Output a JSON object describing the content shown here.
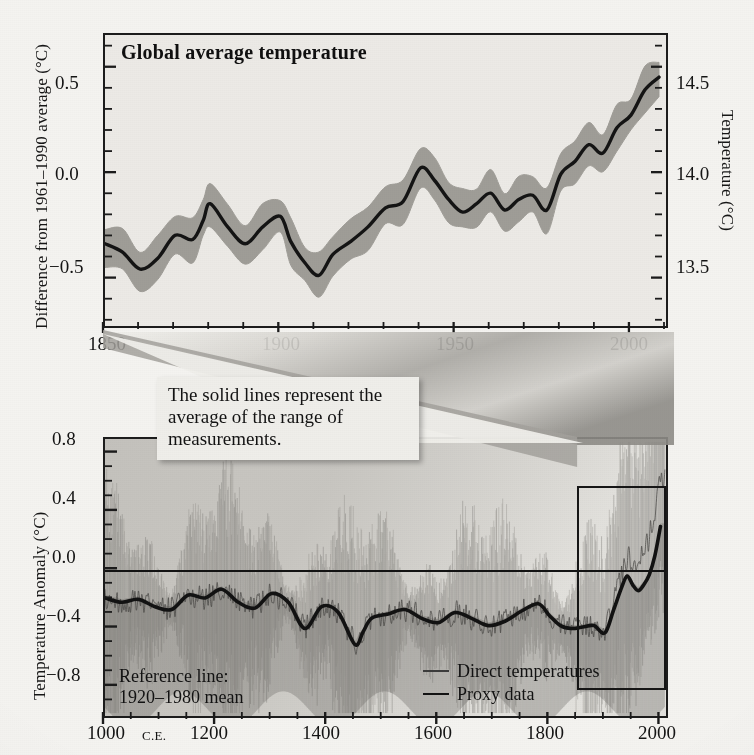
{
  "figure": {
    "masthead_faint": "",
    "background_hex": "#f4f3f0",
    "ink_hex": "#161616",
    "band_hex": "#9a9892",
    "bottom_panel_hex": "#b7b5b0"
  },
  "callout": {
    "text": "The solid lines represent the average of the range of measurements."
  },
  "top_chart": {
    "title": "Global average temperature",
    "ylabel_left": "Difference from 1961–1990 average (°C)",
    "ylabel_right": "Temperature (°C)",
    "yticks_left": [
      "0.5",
      "0.0",
      "−0.5"
    ],
    "yticks_right": [
      "14.5",
      "14.0",
      "13.5"
    ],
    "xticks": [
      "1850",
      "1900",
      "1950",
      "2000"
    ]
  },
  "bottom_chart": {
    "ylabel": "Temperature Anomaly (°C)",
    "yticks": [
      "0.8",
      "0.4",
      "0.0",
      "−0.4",
      "−0.8"
    ],
    "xticks": [
      "1000",
      "1200",
      "1400",
      "1600",
      "1800",
      "2000"
    ],
    "xtick_first_suffix": "C.E.",
    "reference_note_line1": "Reference line:",
    "reference_note_line2": "1920–1980 mean",
    "legend": [
      {
        "label": "Direct temperatures",
        "style": "thin-gray"
      },
      {
        "label": "Proxy data",
        "style": "thick-black"
      }
    ]
  },
  "chart_data": [
    {
      "type": "line",
      "id": "instrumental-record",
      "title": "Global average temperature",
      "xlabel": "",
      "ylabel": "Difference from 1961–1990 average (°C)",
      "ylabel_secondary": "Temperature (°C)",
      "xlim": [
        1850,
        2010
      ],
      "ylim": [
        -0.72,
        0.66
      ],
      "ylim_secondary": [
        13.28,
        14.66
      ],
      "yticks": [
        0.5,
        0.0,
        -0.5
      ],
      "yticks_secondary": [
        14.5,
        14.0,
        13.5
      ],
      "xticks": [
        1850,
        1900,
        1950,
        2000
      ],
      "grid": false,
      "legend": "none",
      "band_label": "uncertainty range",
      "band_halfwidth": 0.09,
      "x": [
        1850,
        1855,
        1860,
        1865,
        1870,
        1875,
        1878,
        1880,
        1885,
        1890,
        1895,
        1900,
        1903,
        1907,
        1911,
        1915,
        1920,
        1925,
        1930,
        1935,
        1940,
        1944,
        1948,
        1952,
        1956,
        1960,
        1964,
        1968,
        1972,
        1976,
        1980,
        1984,
        1988,
        1992,
        1996,
        2000,
        2004,
        2008
      ],
      "values": [
        -0.33,
        -0.37,
        -0.45,
        -0.4,
        -0.29,
        -0.31,
        -0.22,
        -0.14,
        -0.25,
        -0.33,
        -0.25,
        -0.2,
        -0.32,
        -0.42,
        -0.48,
        -0.38,
        -0.32,
        -0.25,
        -0.16,
        -0.13,
        0.03,
        -0.03,
        -0.12,
        -0.18,
        -0.14,
        -0.09,
        -0.17,
        -0.12,
        -0.1,
        -0.17,
        0.0,
        0.06,
        0.14,
        0.1,
        0.22,
        0.28,
        0.4,
        0.46
      ]
    },
    {
      "type": "line",
      "id": "millennial-reconstruction",
      "title": "",
      "xlabel": "",
      "ylabel": "Temperature Anomaly (°C)",
      "xlim": [
        1000,
        2010
      ],
      "ylim": [
        -1.0,
        0.9
      ],
      "yticks": [
        0.8,
        0.4,
        0.0,
        -0.4,
        -0.8
      ],
      "xticks": [
        1000,
        1200,
        1400,
        1600,
        1800,
        2000
      ],
      "grid": false,
      "reference_line": 0.0,
      "inset_box": {
        "x0": 1850,
        "x1": 2010,
        "y0": -0.82,
        "y1": 0.58
      },
      "series": [
        {
          "name": "Proxy data",
          "style": "thick-black",
          "x": [
            1000,
            1030,
            1060,
            1090,
            1120,
            1150,
            1180,
            1210,
            1240,
            1270,
            1300,
            1330,
            1360,
            1390,
            1420,
            1450,
            1465,
            1480,
            1510,
            1540,
            1570,
            1600,
            1630,
            1660,
            1690,
            1720,
            1750,
            1780,
            1800,
            1820,
            1840,
            1860,
            1880,
            1900,
            1915,
            1930,
            1940,
            1950,
            1960,
            1970,
            1980,
            1990,
            2000
          ],
          "values": [
            -0.19,
            -0.22,
            -0.2,
            -0.25,
            -0.27,
            -0.17,
            -0.19,
            -0.13,
            -0.22,
            -0.26,
            -0.16,
            -0.22,
            -0.4,
            -0.25,
            -0.29,
            -0.51,
            -0.42,
            -0.33,
            -0.3,
            -0.27,
            -0.33,
            -0.36,
            -0.29,
            -0.33,
            -0.38,
            -0.35,
            -0.28,
            -0.23,
            -0.31,
            -0.38,
            -0.4,
            -0.39,
            -0.38,
            -0.43,
            -0.28,
            -0.12,
            -0.04,
            -0.1,
            -0.14,
            -0.1,
            -0.03,
            0.1,
            0.3
          ]
        },
        {
          "name": "Direct temperatures",
          "style": "thin-gray",
          "note": "high-frequency annual series spanning the full range of measurements"
        }
      ]
    }
  ]
}
